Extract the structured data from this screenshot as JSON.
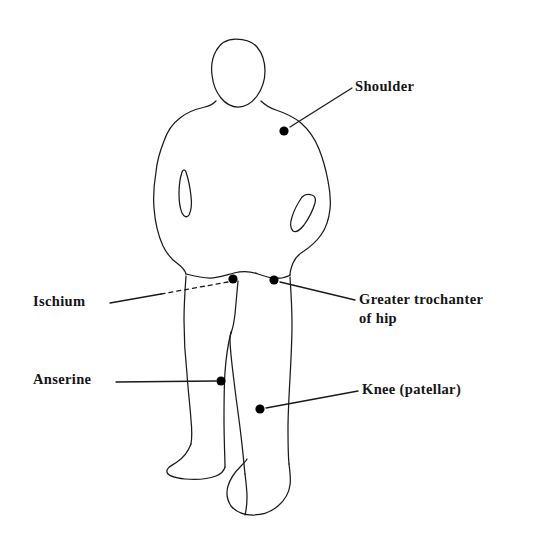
{
  "diagram": {
    "type": "anatomical-landmark-diagram",
    "style": "hand-drawn line illustration, black ink on white",
    "colors": {
      "background": "#ffffff",
      "ink": "#1a1a1a",
      "marker": "#000000",
      "label_text": "#141414"
    },
    "labels": [
      {
        "id": "shoulder",
        "text": "Shoulder",
        "lines": [
          "Shoulder"
        ],
        "marker": {
          "x": 284,
          "y": 131
        },
        "leader": {
          "from_x": 290,
          "from_y": 127,
          "to_x": 352,
          "to_y": 88
        },
        "leader_style": "solid",
        "text_anchor": "start"
      },
      {
        "id": "greater-trochanter",
        "text": "Greater trochanter of hip",
        "lines": [
          "Greater trochanter",
          "of hip"
        ],
        "marker": {
          "x": 274,
          "y": 280
        },
        "leader": {
          "from_x": 280,
          "from_y": 282,
          "to_x": 355,
          "to_y": 300
        },
        "leader_style": "solid",
        "text_anchor": "start"
      },
      {
        "id": "ischium",
        "text": "Ischium",
        "lines": [
          "Ischium"
        ],
        "marker": {
          "x": 233,
          "y": 279
        },
        "leader": {
          "from_x": 110,
          "from_y": 303,
          "to_x": 228,
          "to_y": 282
        },
        "leader_style": "solid-then-dashed",
        "dash_start_x": 161,
        "dash_start_y": 294,
        "text_anchor": "end"
      },
      {
        "id": "anserine",
        "text": "Anserine",
        "lines": [
          "Anserine"
        ],
        "marker": {
          "x": 221,
          "y": 381
        },
        "leader": {
          "from_x": 116,
          "from_y": 382,
          "to_x": 216,
          "to_y": 381
        },
        "leader_style": "solid",
        "text_anchor": "end"
      },
      {
        "id": "knee-patellar",
        "text": "Knee (patellar)",
        "lines": [
          "Knee (patellar)"
        ],
        "marker": {
          "x": 260,
          "y": 409
        },
        "leader": {
          "from_x": 266,
          "from_y": 408,
          "to_x": 358,
          "to_y": 391
        },
        "leader_style": "solid",
        "text_anchor": "start"
      }
    ],
    "marker_radius": 4.6,
    "canvas": {
      "width": 549,
      "height": 547
    }
  }
}
